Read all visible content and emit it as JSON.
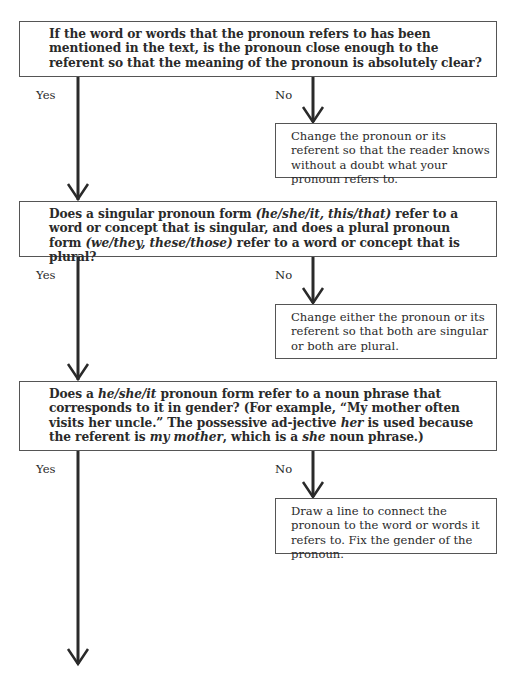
{
  "flowchart": {
    "questions": [
      {
        "id": "q1",
        "segments": [
          {
            "text": "If the word or words that the pronoun refers to has been mentioned in the text, is the pronoun close enough to the referent so that the meaning of the pronoun is absolutely clear?",
            "italic": false
          }
        ]
      },
      {
        "id": "q2",
        "segments": [
          {
            "text": "Does a singular pronoun form ",
            "italic": false
          },
          {
            "text": "(he/she/it, this/that)",
            "italic": true
          },
          {
            "text": " refer to a word or concept that is singular, and does a plural pronoun form ",
            "italic": false
          },
          {
            "text": "(we/they, these/those)",
            "italic": true
          },
          {
            "text": " refer to a word or concept that is plural?",
            "italic": false
          }
        ]
      },
      {
        "id": "q3",
        "segments": [
          {
            "text": "Does a ",
            "italic": false
          },
          {
            "text": "he/she/it",
            "italic": true
          },
          {
            "text": " pronoun form refer to a noun phrase that corresponds to it in gender? (For example, “My mother often visits her uncle.” The possessive ad-jective ",
            "italic": false
          },
          {
            "text": "her",
            "italic": true
          },
          {
            "text": " is used because the referent is ",
            "italic": false
          },
          {
            "text": "my mother",
            "italic": true
          },
          {
            "text": ", which is a ",
            "italic": false
          },
          {
            "text": "she",
            "italic": true
          },
          {
            "text": " noun phrase.)",
            "italic": false
          }
        ]
      }
    ],
    "actions": [
      {
        "id": "a1",
        "text": "Change the pronoun or its referent so that the reader knows without a doubt what your pronoun refers to."
      },
      {
        "id": "a2",
        "text": "Change either the pronoun or its referent so that both are singular or both are plural."
      },
      {
        "id": "a3",
        "text": "Draw a line to connect the pronoun to the word or words it refers to. Fix the gender of the pronoun."
      }
    ],
    "labels": {
      "yes": "Yes",
      "no": "No"
    },
    "colors": {
      "line": "#2a2a2a",
      "border": "#555555",
      "text": "#2a2a2a"
    }
  }
}
